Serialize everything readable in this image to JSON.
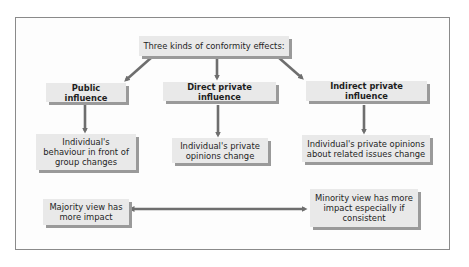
{
  "diagram": {
    "root": {
      "label": "Three kinds of conformity effects:"
    },
    "branches": [
      {
        "label": "Public influence",
        "outcome": "Individual's behaviour in front of group changes"
      },
      {
        "label": "Direct private influence",
        "outcome": "Individual's private opinions change"
      },
      {
        "label": "Indirect private influence",
        "outcome": "Individual's private opinions about related issues change"
      }
    ],
    "comparison": {
      "left": "Majority view has more impact",
      "right": "Minority view has more impact especially if consistent",
      "relation": "bidirectional"
    },
    "colors": {
      "box_fill": "#e9e9e9",
      "box_shadow": "#9a9a9a",
      "arrow": "#6e6e6e",
      "frame": "#8a8a8a"
    }
  }
}
